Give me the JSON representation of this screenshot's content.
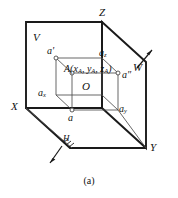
{
  "figure": {
    "caption": "(a)",
    "type": "three-plane-orthographic-projection",
    "axes": {
      "x_label": "X",
      "y_label": "Y",
      "z_label": "Z"
    },
    "planes": {
      "v_label": "V",
      "w_label": "W",
      "h_label": "H"
    },
    "origin_label": "O",
    "point": {
      "main_label": "A(x",
      "main_sub1": "A",
      "main_mid": ", y",
      "main_sub2": "A",
      "main_mid2": ", z",
      "main_sub3": "A",
      "main_end": ")",
      "full_text": "A(xA, yA, zA)"
    },
    "projections": {
      "front_label": "a'",
      "side_label": "a″",
      "top_label": "a"
    },
    "axis_points": {
      "ax_label": "a",
      "ax_sub": "x",
      "ay_label": "a",
      "ay_sub": "y",
      "az_label": "a",
      "az_sub": "z"
    },
    "colors": {
      "stroke_heavy": "#1a1a1a",
      "stroke_light": "#555555",
      "text": "#111111",
      "background": "#ffffff"
    }
  }
}
